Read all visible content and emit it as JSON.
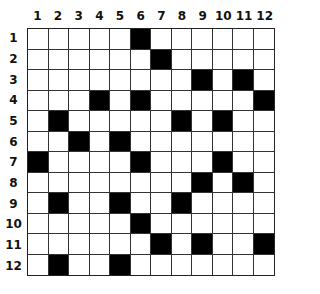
{
  "puzzle": {
    "rows": 12,
    "cols": 12,
    "col_labels": [
      "1",
      "2",
      "3",
      "4",
      "5",
      "6",
      "7",
      "8",
      "9",
      "10",
      "11",
      "12"
    ],
    "row_labels": [
      "1",
      "2",
      "3",
      "4",
      "5",
      "6",
      "7",
      "8",
      "9",
      "10",
      "11",
      "12"
    ],
    "black_cells": {
      "1": [
        6
      ],
      "2": [
        7
      ],
      "3": [
        9,
        11
      ],
      "4": [
        4,
        6,
        12
      ],
      "5": [
        2,
        8,
        10
      ],
      "6": [
        3,
        5
      ],
      "7": [
        1,
        6,
        10
      ],
      "8": [
        9,
        11
      ],
      "9": [
        2,
        5,
        8
      ],
      "10": [
        6
      ],
      "11": [
        7,
        9,
        12
      ],
      "12": [
        2,
        5
      ]
    },
    "colors": {
      "black": "#000000",
      "white": "#ffffff",
      "line": "#333333"
    }
  }
}
